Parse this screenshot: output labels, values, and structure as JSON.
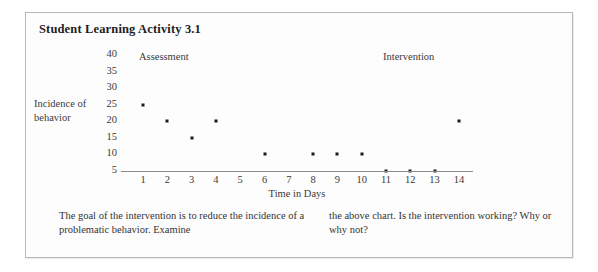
{
  "page_title": "Student Learning Activity 3.1",
  "chart_data": {
    "type": "scatter",
    "title": "",
    "xlabel": "Time in Days",
    "ylabel": "Incidence of behavior",
    "ylabel_lines": [
      "Incidence of",
      "behavior"
    ],
    "x": [
      1,
      2,
      3,
      4,
      5,
      6,
      7,
      8,
      9,
      10,
      11,
      12,
      13,
      14
    ],
    "categories": [
      "1",
      "2",
      "3",
      "4",
      "5",
      "6",
      "7",
      "8",
      "9",
      "10",
      "11",
      "12",
      "13",
      "14"
    ],
    "values": [
      25,
      20,
      15,
      20,
      null,
      10,
      null,
      10,
      10,
      10,
      5,
      5,
      5,
      20
    ],
    "points": [
      {
        "x": 1,
        "y": 25
      },
      {
        "x": 2,
        "y": 20
      },
      {
        "x": 3,
        "y": 15
      },
      {
        "x": 4,
        "y": 20
      },
      {
        "x": 6,
        "y": 10
      },
      {
        "x": 8,
        "y": 10
      },
      {
        "x": 9,
        "y": 10
      },
      {
        "x": 10,
        "y": 10
      },
      {
        "x": 11,
        "y": 5
      },
      {
        "x": 12,
        "y": 5
      },
      {
        "x": 13,
        "y": 5
      },
      {
        "x": 14,
        "y": 20
      }
    ],
    "yticks": [
      40,
      35,
      30,
      25,
      20,
      15,
      10,
      5
    ],
    "ytick_labels": [
      "40",
      "35",
      "30",
      "25",
      "20",
      "15",
      "10",
      "5"
    ],
    "ylim": [
      0,
      42.5
    ],
    "xlim": [
      0.5,
      14.5
    ],
    "grid": false,
    "legend": "none",
    "annotations": [
      {
        "name": "assessment",
        "text": "Assessment",
        "phase_start": 1,
        "phase_end": 10
      },
      {
        "name": "intervention",
        "text": "Intervention",
        "phase_start": 11,
        "phase_end": 14
      }
    ],
    "marker_color": "#1a1a1a",
    "axis_color": "#8d8d8d"
  },
  "prompt": {
    "left_column": "The goal of the intervention is to reduce the incidence of a problematic behavior. Examine",
    "right_column": "the above chart. Is the intervention working? Why or why not?"
  }
}
